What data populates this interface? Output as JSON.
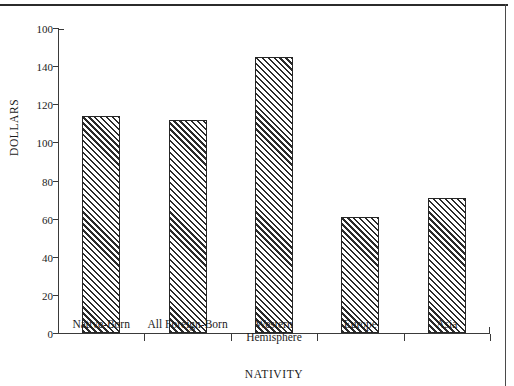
{
  "chart_data": {
    "type": "bar",
    "title": "",
    "subtitle": "",
    "xlabel": "NATIVITY",
    "ylabel": "DOLLARS",
    "categories": [
      "Native-Born",
      "All Foreign-Born",
      "Western Hemisphere",
      "Europe",
      "Asia"
    ],
    "category_lines": [
      [
        "Native-Born"
      ],
      [
        "All Foreign-Born"
      ],
      [
        "Western",
        "Hemisphere"
      ],
      [
        "Europe"
      ],
      [
        "Asia"
      ]
    ],
    "values": [
      114,
      112,
      145,
      61,
      71
    ],
    "ylim": [
      0,
      160
    ],
    "ytick_values": [
      0,
      20,
      40,
      60,
      80,
      100,
      120,
      140,
      160
    ],
    "ytick_labels": [
      "0",
      "20",
      "40",
      "60",
      "80",
      "100",
      "120",
      "140",
      "100"
    ],
    "grid": false,
    "legend": null,
    "bar_fill": "hatch-diagonal-45",
    "bar_color": "#2b2b2b",
    "bar_background": "#f2f2f2",
    "axis_color": "#3a3a3a",
    "text_color": "#1b1b1b"
  },
  "figure": {
    "rule_color": "#2b2b2b",
    "border_color": "#4a4a4a"
  }
}
